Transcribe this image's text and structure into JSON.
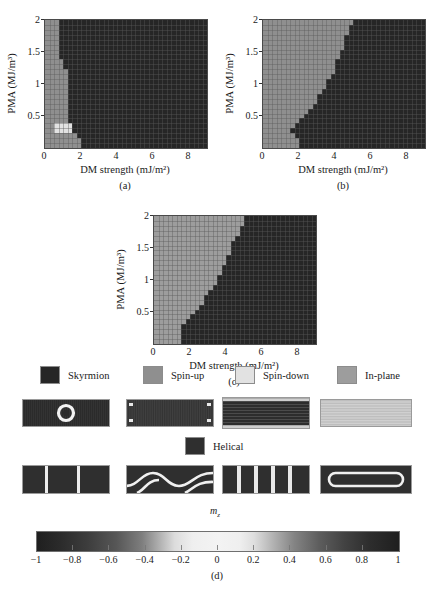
{
  "figure": {
    "axis_x_label": "DM strength (mJ/m²)",
    "axis_y_label": "PMA (MJ/m³)",
    "panel_labels": {
      "a": "(a)",
      "b": "(b)",
      "c": "(c)",
      "d": "(d)"
    },
    "mz_label": "m",
    "mz_subscript": "z"
  },
  "chart_data": {
    "type": "heatmap",
    "title": "",
    "xlabel": "DM strength (mJ/m²)",
    "ylabel": "PMA (MJ/m³)",
    "xlim": [
      0,
      9
    ],
    "ylim": [
      0,
      2
    ],
    "xticks": [
      0,
      2,
      4,
      6,
      8
    ],
    "xtick_labels": [
      "0",
      "2",
      "4",
      "6",
      "8"
    ],
    "yticks": [
      0.5,
      1,
      1.5,
      2
    ],
    "ytick_labels": [
      "0.5",
      "1",
      "1.5",
      "2"
    ],
    "grid": true,
    "legend_position": "below",
    "categories": [
      "Skyrmion",
      "Spin-up",
      "Spin-down",
      "In-plane",
      "Helical"
    ],
    "category_colors": {
      "Skyrmion": "#262626",
      "Spin-up": "#8f8f8f",
      "Spin-down": "#e2e2e2",
      "In-plane": "#9d9d9d",
      "Helical": "#2f2f2f"
    },
    "panels": [
      {
        "id": "a",
        "label": "(a)",
        "description": "Phase diagram: narrow Spin-up strip at low DM strength, Skyrmion elsewhere, small Spin-down island near PMA 0.25",
        "boundary_dm_by_pma": [
          {
            "pma": 0.1,
            "dm": 2.0
          },
          {
            "pma": 0.2,
            "dm": 1.6
          },
          {
            "pma": 0.3,
            "dm": 1.6
          },
          {
            "pma": 0.4,
            "dm": 1.2
          },
          {
            "pma": 0.6,
            "dm": 1.2
          },
          {
            "pma": 0.8,
            "dm": 1.2
          },
          {
            "pma": 1.0,
            "dm": 1.2
          },
          {
            "pma": 1.2,
            "dm": 1.2
          },
          {
            "pma": 1.4,
            "dm": 0.8
          },
          {
            "pma": 1.6,
            "dm": 0.8
          },
          {
            "pma": 1.8,
            "dm": 0.8
          },
          {
            "pma": 2.0,
            "dm": 0.8
          }
        ],
        "spin_down_island": {
          "dm_range": [
            0.4,
            1.6
          ],
          "pma_range": [
            0.2,
            0.35
          ]
        }
      },
      {
        "id": "b",
        "label": "(b)",
        "description": "Phase diagram: diagonal boundary, Spin-up at low DM / high PMA, Skyrmion at high DM",
        "boundary_dm_by_pma": [
          {
            "pma": 0.1,
            "dm": 2.1
          },
          {
            "pma": 0.2,
            "dm": 1.8
          },
          {
            "pma": 0.3,
            "dm": 1.4
          },
          {
            "pma": 0.4,
            "dm": 1.9
          },
          {
            "pma": 0.5,
            "dm": 2.3
          },
          {
            "pma": 0.6,
            "dm": 2.6
          },
          {
            "pma": 0.7,
            "dm": 2.9
          },
          {
            "pma": 0.8,
            "dm": 3.1
          },
          {
            "pma": 0.9,
            "dm": 3.3
          },
          {
            "pma": 1.0,
            "dm": 3.5
          },
          {
            "pma": 1.1,
            "dm": 3.7
          },
          {
            "pma": 1.2,
            "dm": 3.9
          },
          {
            "pma": 1.35,
            "dm": 4.1
          },
          {
            "pma": 1.5,
            "dm": 4.3
          },
          {
            "pma": 1.65,
            "dm": 4.5
          },
          {
            "pma": 1.8,
            "dm": 4.7
          },
          {
            "pma": 1.9,
            "dm": 4.9
          },
          {
            "pma": 2.0,
            "dm": 5.0
          }
        ]
      },
      {
        "id": "c",
        "label": "(c)",
        "description": "Phase diagram: diagonal boundary similar to (b), In-plane at low DM, Skyrmion at high DM",
        "boundary_dm_by_pma": [
          {
            "pma": 0.1,
            "dm": 1.4
          },
          {
            "pma": 0.2,
            "dm": 1.4
          },
          {
            "pma": 0.3,
            "dm": 1.7
          },
          {
            "pma": 0.4,
            "dm": 2.0
          },
          {
            "pma": 0.5,
            "dm": 2.3
          },
          {
            "pma": 0.6,
            "dm": 2.6
          },
          {
            "pma": 0.7,
            "dm": 2.8
          },
          {
            "pma": 0.8,
            "dm": 3.0
          },
          {
            "pma": 0.9,
            "dm": 3.3
          },
          {
            "pma": 1.0,
            "dm": 3.5
          },
          {
            "pma": 1.1,
            "dm": 3.7
          },
          {
            "pma": 1.25,
            "dm": 3.9
          },
          {
            "pma": 1.4,
            "dm": 4.1
          },
          {
            "pma": 1.55,
            "dm": 4.3
          },
          {
            "pma": 1.7,
            "dm": 4.6
          },
          {
            "pma": 1.85,
            "dm": 4.9
          },
          {
            "pma": 2.0,
            "dm": 5.0
          }
        ]
      }
    ],
    "colorbar": {
      "label": "m_z",
      "min": -1,
      "max": 1,
      "ticks": [
        -1,
        -0.8,
        -0.6,
        -0.4,
        -0.2,
        0,
        0.2,
        0.4,
        0.6,
        0.8,
        1
      ],
      "tick_labels": [
        "−1",
        "−0.8",
        "−0.6",
        "−0.4",
        "−0.2",
        "0",
        "0.2",
        "0.4",
        "0.6",
        "0.8",
        "1"
      ]
    }
  },
  "legend": {
    "row1": [
      {
        "label": "Skyrmion",
        "color": "#262626"
      },
      {
        "label": "Spin-up",
        "color": "#8f8f8f"
      },
      {
        "label": "Spin-down",
        "color": "#e2e2e2"
      },
      {
        "label": "In-plane",
        "color": "#9d9d9d"
      }
    ],
    "row2": [
      {
        "label": "Helical",
        "color": "#2f2f2f"
      }
    ]
  },
  "texture_strips": {
    "row1": [
      {
        "name": "skyrmion-texture",
        "pattern": "ring"
      },
      {
        "name": "spin-up-texture",
        "pattern": "vertical-stripes"
      },
      {
        "name": "spin-down-texture",
        "pattern": "uniform-dark"
      },
      {
        "name": "in-plane-texture",
        "pattern": "light-horizontal-lines"
      }
    ],
    "row2": [
      {
        "name": "helical-texture-1",
        "pattern": "vertical-bands"
      },
      {
        "name": "helical-texture-2",
        "pattern": "serpentine"
      },
      {
        "name": "helical-texture-3",
        "pattern": "stripe-domains"
      },
      {
        "name": "helical-texture-4",
        "pattern": "racetrack-loop"
      }
    ]
  },
  "caption": {
    "text": ""
  }
}
